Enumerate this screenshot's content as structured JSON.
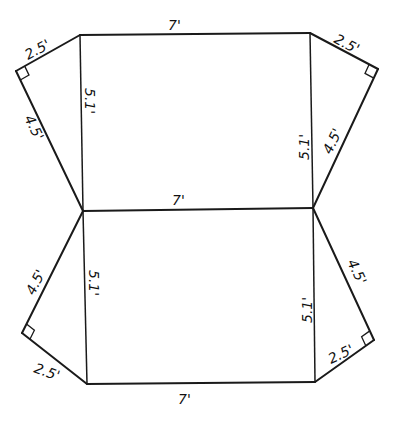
{
  "diagram": {
    "type": "geometric-net",
    "stroke_color": "#1a1a1a",
    "background": "#ffffff",
    "labels": {
      "top_edge": "7'",
      "middle_edge": "7'",
      "bottom_edge": "7'",
      "upper_left_inner": "5.1'",
      "upper_right_inner": "5.1'",
      "lower_left_inner": "5.1'",
      "lower_right_inner": "5.1'",
      "upper_left_short_leg": "2.5'",
      "upper_left_long_leg": "4.5'",
      "upper_right_short_leg": "2.5'",
      "upper_right_long_leg": "4.5'",
      "lower_left_short_leg": "2.5'",
      "lower_left_long_leg": "4.5'",
      "lower_right_short_leg": "2.5'",
      "lower_right_long_leg": "4.5'"
    },
    "shapes": [
      {
        "name": "upper-rectangle",
        "width": "7'",
        "height": "5.1'"
      },
      {
        "name": "lower-rectangle",
        "width": "7'",
        "height": "5.1'"
      },
      {
        "name": "upper-left-triangle",
        "legs": [
          "2.5'",
          "4.5'"
        ],
        "right_angle": true
      },
      {
        "name": "upper-right-triangle",
        "legs": [
          "2.5'",
          "4.5'"
        ],
        "right_angle": true
      },
      {
        "name": "lower-left-triangle",
        "legs": [
          "2.5'",
          "4.5'"
        ],
        "right_angle": true
      },
      {
        "name": "lower-right-triangle",
        "legs": [
          "2.5'",
          "4.5'"
        ],
        "right_angle": true
      }
    ]
  }
}
